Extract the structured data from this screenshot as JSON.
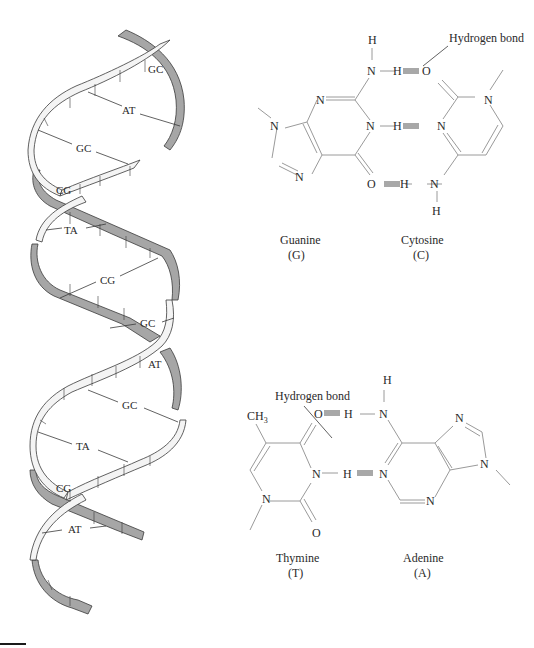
{
  "figure": {
    "helix": {
      "base_pairs": [
        {
          "label": "GC",
          "x": 154,
          "y": 69
        },
        {
          "label": "AT",
          "x": 130,
          "y": 110
        },
        {
          "label": "GC",
          "x": 84,
          "y": 148
        },
        {
          "label": "CG",
          "x": 62,
          "y": 190
        },
        {
          "label": "TA",
          "x": 72,
          "y": 230
        },
        {
          "label": "CG",
          "x": 108,
          "y": 280
        },
        {
          "label": "GC",
          "x": 148,
          "y": 323
        },
        {
          "label": "AT",
          "x": 154,
          "y": 364
        },
        {
          "label": "GC",
          "x": 130,
          "y": 405
        },
        {
          "label": "TA",
          "x": 84,
          "y": 446
        },
        {
          "label": "CG",
          "x": 62,
          "y": 488
        },
        {
          "label": "AT",
          "x": 76,
          "y": 529
        }
      ],
      "colors": {
        "front_strand": "#f4f4f4",
        "back_strand": "#a6a6a6",
        "outline": "#3a3a3a"
      }
    },
    "gc_pair": {
      "hydrogen_bond_label": "Hydrogen bond",
      "left_name": "Guanine",
      "left_abbr": "(G)",
      "right_name": "Cytosine",
      "right_abbr": "(C)"
    },
    "at_pair": {
      "hydrogen_bond_label": "Hydrogen bond",
      "methyl_label": "CH",
      "methyl_sub": "3",
      "left_name": "Thymine",
      "left_abbr": "(T)",
      "right_name": "Adenine",
      "right_abbr": "(A)"
    },
    "atoms": {
      "N": "N",
      "H": "H",
      "O": "O"
    },
    "colors": {
      "bond_line": "#9a9a9a",
      "hydrogen_bond": "#a8a8a8",
      "text": "#2a2a2a"
    }
  }
}
